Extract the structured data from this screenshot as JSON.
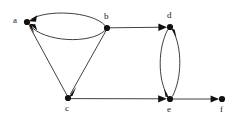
{
  "figure": {
    "type": "directed-graph-diagram",
    "background_color": "#ffffff",
    "node_color": "#111111",
    "edge_color": "#2b2b2b",
    "label_color": "#1a1a1a"
  },
  "nodes": [
    {
      "id": "a",
      "label": "a",
      "x": 27,
      "y": 22,
      "label_x": 13,
      "label_y": 16
    },
    {
      "id": "b",
      "label": "b",
      "x": 107,
      "y": 28,
      "label_x": 104,
      "label_y": 12
    },
    {
      "id": "c",
      "label": "c",
      "x": 68,
      "y": 98,
      "label_x": 65,
      "label_y": 104
    },
    {
      "id": "d",
      "label": "d",
      "x": 170,
      "y": 27,
      "label_x": 167,
      "label_y": 11
    },
    {
      "id": "e",
      "label": "e",
      "x": 170,
      "y": 99,
      "label_x": 167,
      "label_y": 105
    },
    {
      "id": "f",
      "label": "f",
      "x": 222,
      "y": 99,
      "label_x": 220,
      "label_y": 105
    }
  ],
  "edges": [
    {
      "id": "b-a-upper",
      "from": "b",
      "to": "a",
      "shape": "curve",
      "arrow_at": "a"
    },
    {
      "id": "b-a-lower",
      "from": "b",
      "to": "a",
      "shape": "curve",
      "arrow_at": "a"
    },
    {
      "id": "c-a",
      "from": "c",
      "to": "a",
      "shape": "line",
      "arrow_at": "a"
    },
    {
      "id": "b-c",
      "from": "b",
      "to": "c",
      "shape": "line",
      "arrow_at": "c"
    },
    {
      "id": "b-d",
      "from": "b",
      "to": "d",
      "shape": "line",
      "arrow_at": "d"
    },
    {
      "id": "d-e-left",
      "from": "d",
      "to": "e",
      "shape": "curve",
      "arrow_at": "e"
    },
    {
      "id": "e-d-right",
      "from": "e",
      "to": "d",
      "shape": "curve",
      "arrow_at": "d"
    },
    {
      "id": "c-e",
      "from": "c",
      "to": "e",
      "shape": "line",
      "arrow_at": "e"
    },
    {
      "id": "e-f",
      "from": "e",
      "to": "f",
      "shape": "line",
      "arrow_at": "f"
    }
  ]
}
